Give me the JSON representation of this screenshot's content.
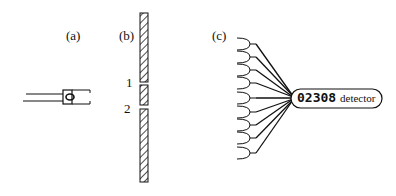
{
  "panels": {
    "a": {
      "label": "(a)"
    },
    "b": {
      "label": "(b)",
      "slit_labels": [
        "1",
        "2"
      ]
    },
    "c": {
      "label": "(c)",
      "counter": "02308",
      "detector_label": "detector",
      "horn_count": 9
    }
  },
  "colors": {
    "ink": "#111111",
    "background": "#ffffff"
  }
}
